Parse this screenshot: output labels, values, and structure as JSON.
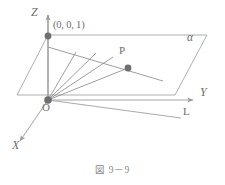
{
  "figure": {
    "caption": "図 9－9",
    "plane_label": "α",
    "labels": {
      "z_axis": "Z",
      "y_axis": "Y",
      "x_axis": "X",
      "origin": "O",
      "point_p": "P",
      "point_001": "(0, 0, 1)",
      "line_l": "L"
    },
    "colors": {
      "stroke": "#8d8d8d",
      "axis_stroke": "#9a9a9a",
      "dot_fill": "#6f6f6f",
      "text": "#6d6d6d",
      "caption_text": "#8a8a8a",
      "background": "#ffffff"
    },
    "geometry": {
      "origin": {
        "x": 48,
        "y": 100
      },
      "point_001": {
        "x": 48,
        "y": 36
      },
      "point_p": {
        "x": 128,
        "y": 68
      },
      "plane_corners": [
        {
          "x": 48,
          "y": 35
        },
        {
          "x": 207,
          "y": 35
        },
        {
          "x": 175,
          "y": 95
        },
        {
          "x": 17,
          "y": 95
        }
      ],
      "z_axis_tip": {
        "x": 48,
        "y": 13
      },
      "y_axis_tip": {
        "x": 196,
        "y": 100
      },
      "x_axis_tip": {
        "x": 17,
        "y": 144
      },
      "line_l_end": {
        "x": 181,
        "y": 118
      },
      "fan_ray_ends": [
        {
          "x": 76,
          "y": 52
        },
        {
          "x": 96,
          "y": 53
        },
        {
          "x": 113,
          "y": 57
        },
        {
          "x": 128,
          "y": 68
        }
      ],
      "chord_from_001_end": {
        "x": 160,
        "y": 80
      }
    },
    "label_positions": {
      "z_axis": {
        "x": 32,
        "y": 13
      },
      "y_axis": {
        "x": 201,
        "y": 92
      },
      "x_axis": {
        "x": 13,
        "y": 146
      },
      "origin": {
        "x": 44,
        "y": 105
      },
      "point_p": {
        "x": 120,
        "y": 50
      },
      "point_001": {
        "x": 54,
        "y": 26
      },
      "line_l": {
        "x": 184,
        "y": 112
      },
      "plane_label": {
        "x": 189,
        "y": 39
      }
    }
  }
}
